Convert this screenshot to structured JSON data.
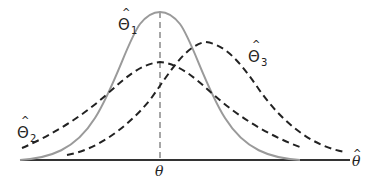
{
  "diagram": {
    "axis_label": "θ",
    "axis_label_hat": "^",
    "true_value_label": "θ",
    "curves": [
      {
        "id": "theta1",
        "label_base": "Θ",
        "label_sub": "1",
        "label_hat": "^",
        "style": "solid",
        "color": "#9a9a9a",
        "note": "unbiased, low variance"
      },
      {
        "id": "theta2",
        "label_base": "Θ",
        "label_sub": "2",
        "label_hat": "^",
        "style": "dashed",
        "color": "#222222",
        "note": "unbiased, high variance"
      },
      {
        "id": "theta3",
        "label_base": "Θ",
        "label_sub": "3",
        "label_hat": "^",
        "style": "dashed",
        "color": "#222222",
        "note": "biased"
      }
    ],
    "colors": {
      "axis": "#333333",
      "solid_curve": "#9a9a9a",
      "dashed_curve": "#222222",
      "center_line": "#777777"
    }
  }
}
